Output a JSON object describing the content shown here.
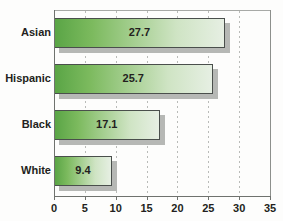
{
  "chart_data": {
    "type": "bar",
    "orientation": "horizontal",
    "title": "",
    "subtitle": "",
    "xlabel": "",
    "ylabel": "",
    "categories": [
      "White",
      "Black",
      "Hispanic",
      "Asian"
    ],
    "values": [
      9.4,
      17.1,
      25.7,
      27.7
    ],
    "value_labels": [
      "9.4",
      "17.1",
      "25.7",
      "27.7"
    ],
    "xlim": [
      0,
      35
    ],
    "xticks": [
      0,
      5,
      10,
      15,
      20,
      25,
      30,
      35
    ],
    "xtick_labels": [
      "0",
      "5",
      "10",
      "15",
      "20",
      "25",
      "30",
      "35"
    ],
    "grid": "vertical-dotted",
    "legend": "none",
    "bar_fill_start_color": "#5aa546",
    "bar_fill_end_color": "#e6efe3",
    "bar_border_color": "#4a4f4c",
    "bar_shadow_color": "#b6b8b5",
    "axis_color": "#6f726e",
    "gridline_color": "#b9bbb8",
    "text_color": "#231f20",
    "background_color": "#fdfdfc"
  },
  "bars": [
    {
      "category": "Asian",
      "value": 27.7,
      "label": "27.7"
    },
    {
      "category": "Hispanic",
      "value": 25.7,
      "label": "25.7"
    },
    {
      "category": "Black",
      "value": 17.1,
      "label": "17.1"
    },
    {
      "category": "White",
      "value": 9.4,
      "label": "9.4"
    }
  ],
  "xaxis": {
    "ticks": [
      {
        "value": 0,
        "label": "0"
      },
      {
        "value": 5,
        "label": "5"
      },
      {
        "value": 10,
        "label": "10"
      },
      {
        "value": 15,
        "label": "15"
      },
      {
        "value": 20,
        "label": "20"
      },
      {
        "value": 25,
        "label": "25"
      },
      {
        "value": 30,
        "label": "30"
      },
      {
        "value": 35,
        "label": "35"
      }
    ]
  }
}
